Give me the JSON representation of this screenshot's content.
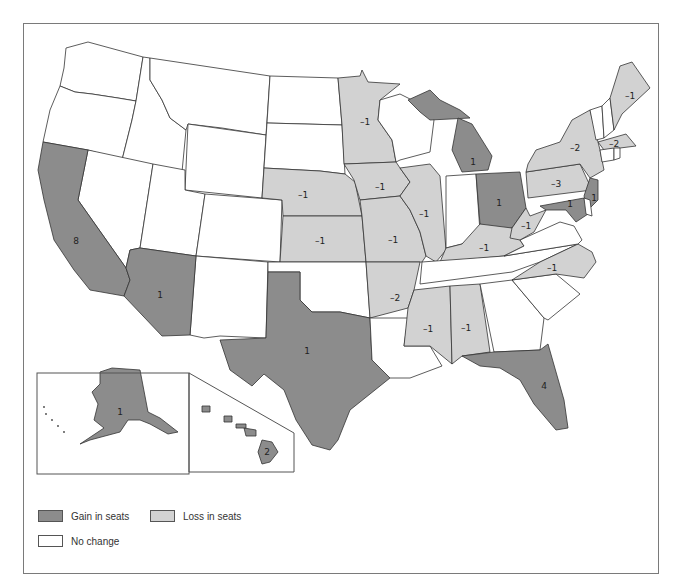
{
  "colors": {
    "gain": "#8c8c8c",
    "loss": "#d2d2d2",
    "none": "#ffffff",
    "border": "#333333"
  },
  "legend": {
    "gain_label": "Gain in seats",
    "loss_label": "Loss in seats",
    "none_label": "No change"
  },
  "chart_data": {
    "type": "choropleth",
    "title": "",
    "legend": [
      "Gain in seats",
      "Loss in seats",
      "No change"
    ],
    "states": [
      {
        "state": "California",
        "category": "gain",
        "change": 8
      },
      {
        "state": "Arizona",
        "category": "gain",
        "change": 1
      },
      {
        "state": "Texas",
        "category": "gain",
        "change": 1
      },
      {
        "state": "Florida",
        "category": "gain",
        "change": 4
      },
      {
        "state": "Michigan",
        "category": "gain",
        "change": 1
      },
      {
        "state": "Ohio",
        "category": "gain",
        "change": 1
      },
      {
        "state": "New Jersey",
        "category": "gain",
        "change": 1
      },
      {
        "state": "Maryland",
        "category": "gain",
        "change": 1
      },
      {
        "state": "Alaska",
        "category": "gain",
        "change": 1
      },
      {
        "state": "Hawaii",
        "category": "gain",
        "change": 2
      },
      {
        "state": "Minnesota",
        "category": "loss",
        "change": -1
      },
      {
        "state": "Nebraska",
        "category": "loss",
        "change": -1
      },
      {
        "state": "Kansas",
        "category": "loss",
        "change": -1
      },
      {
        "state": "Iowa",
        "category": "loss",
        "change": -1
      },
      {
        "state": "Missouri",
        "category": "loss",
        "change": -1
      },
      {
        "state": "Arkansas",
        "category": "loss",
        "change": -2
      },
      {
        "state": "Illinois",
        "category": "loss",
        "change": -1
      },
      {
        "state": "Kentucky",
        "category": "loss",
        "change": -1
      },
      {
        "state": "West Virginia",
        "category": "loss",
        "change": -1
      },
      {
        "state": "North Carolina",
        "category": "loss",
        "change": -1
      },
      {
        "state": "Mississippi",
        "category": "loss",
        "change": -1
      },
      {
        "state": "Alabama",
        "category": "loss",
        "change": -1
      },
      {
        "state": "Pennsylvania",
        "category": "loss",
        "change": -3
      },
      {
        "state": "New York",
        "category": "loss",
        "change": -2
      },
      {
        "state": "Massachusetts",
        "category": "loss",
        "change": -2
      },
      {
        "state": "Maine",
        "category": "loss",
        "change": -1
      }
    ]
  },
  "map": {
    "shapes": [
      {
        "name": "washington",
        "cat": "none",
        "pts": "66,48 88,42 143,57 136,101 118,98 92,94 75,92 60,86 64,68"
      },
      {
        "name": "oregon",
        "cat": "none",
        "pts": "60,86 75,92 92,94 118,98 136,101 132,120 122,160 88,150 43,142 50,110"
      },
      {
        "name": "idaho",
        "cat": "none",
        "pts": "143,57 150,58 150,80 162,100 170,118 186,130 182,172 122,160 132,120 136,101"
      },
      {
        "name": "montana",
        "cat": "none",
        "pts": "150,58 270,76 266,135 222,128 188,124 186,130 170,118 162,100 150,80"
      },
      {
        "name": "wyoming",
        "cat": "none",
        "pts": "188,124 266,135 262,198 185,190"
      },
      {
        "name": "nevada",
        "cat": "none",
        "pts": "88,150 153,164 140,248 130,250 126,268 78,200"
      },
      {
        "name": "utah",
        "cat": "none",
        "pts": "153,164 185,170 185,190 205,194 196,256 140,248"
      },
      {
        "name": "colorado",
        "cat": "none",
        "pts": "205,194 282,200 280,262 196,256"
      },
      {
        "name": "new-mexico",
        "cat": "none",
        "pts": "196,256 268,262 266,338 220,336 204,338 190,335"
      },
      {
        "name": "north-dakota",
        "cat": "none",
        "pts": "270,76 338,78 342,125 267,123"
      },
      {
        "name": "south-dakota",
        "cat": "none",
        "pts": "267,123 342,125 345,174 320,171 264,168"
      },
      {
        "name": "nebraska",
        "cat": "loss",
        "pts": "264,168 320,171 345,174 355,182 362,216 283,216 282,200 262,198"
      },
      {
        "name": "kansas",
        "cat": "loss",
        "pts": "283,216 362,216 366,262 280,262"
      },
      {
        "name": "oklahoma",
        "cat": "none",
        "pts": "268,262 366,262 370,318 340,312 312,312 300,300 300,272 268,272"
      },
      {
        "name": "california",
        "cat": "gain",
        "pts": "43,142 88,150 78,200 126,268 130,280 124,296 90,290 74,270 54,240 44,200 38,170"
      },
      {
        "name": "arizona",
        "cat": "gain",
        "pts": "140,248 196,256 190,335 162,336 124,296 130,280 126,268 130,250"
      },
      {
        "name": "texas",
        "cat": "gain",
        "pts": "268,272 300,272 300,300 312,312 340,312 370,318 372,360 390,378 350,410 338,440 330,450 312,445 296,420 284,390 264,374 252,386 230,370 220,340 266,338"
      },
      {
        "name": "minnesota",
        "cat": "loss",
        "pts": "338,78 360,76 362,70 368,82 400,84 380,100 378,120 392,140 396,162 344,164 342,125"
      },
      {
        "name": "iowa",
        "cat": "loss",
        "pts": "344,164 396,162 400,168 410,182 400,196 360,200 354,180"
      },
      {
        "name": "missouri",
        "cat": "loss",
        "pts": "360,200 400,196 410,210 420,232 426,256 422,262 366,262 362,216"
      },
      {
        "name": "arkansas",
        "cat": "loss",
        "pts": "366,262 420,262 414,290 408,308 370,318"
      },
      {
        "name": "louisiana",
        "cat": "none",
        "pts": "370,318 408,318 404,346 430,346 442,366 410,378 390,378 372,360"
      },
      {
        "name": "wisconsin",
        "cat": "none",
        "pts": "380,100 400,94 420,104 430,110 434,120 430,152 400,160 396,162 392,140 378,120"
      },
      {
        "name": "illinois",
        "cat": "loss",
        "pts": "400,168 430,164 440,176 446,250 436,262 426,256 420,232 410,210 400,196 410,182"
      },
      {
        "name": "michigan-up",
        "cat": "gain",
        "pts": "408,100 430,90 440,100 460,110 470,118 430,120 420,112"
      },
      {
        "name": "michigan",
        "cat": "gain",
        "pts": "458,118 472,124 492,156 488,170 462,172 452,150"
      },
      {
        "name": "indiana",
        "cat": "none",
        "pts": "446,176 476,174 480,232 462,244 446,248"
      },
      {
        "name": "ohio",
        "cat": "gain",
        "pts": "476,174 520,172 526,208 512,228 492,230 480,224"
      },
      {
        "name": "kentucky",
        "cat": "loss",
        "pts": "446,248 462,244 480,224 512,228 524,246 504,256 440,262"
      },
      {
        "name": "tennessee",
        "cat": "none",
        "pts": "422,262 504,256 578,244 540,262 512,272 420,284"
      },
      {
        "name": "mississippi",
        "cat": "loss",
        "pts": "414,290 450,286 452,364 430,346 404,346 408,308"
      },
      {
        "name": "alabama",
        "cat": "loss",
        "pts": "450,286 480,284 490,352 462,356 452,364"
      },
      {
        "name": "georgia",
        "cat": "none",
        "pts": "480,284 512,280 544,318 540,350 494,352"
      },
      {
        "name": "florida",
        "cat": "gain",
        "pts": "462,356 494,352 540,350 548,344 564,400 568,428 556,430 534,404 520,380 500,368 480,366"
      },
      {
        "name": "south-carolina",
        "cat": "none",
        "pts": "512,280 556,274 580,294 548,320 544,318"
      },
      {
        "name": "north-carolina",
        "cat": "loss",
        "pts": "540,262 578,244 592,252 596,262 584,278 556,274 512,280"
      },
      {
        "name": "virginia",
        "cat": "none",
        "pts": "520,240 560,222 574,226 582,240 578,244 504,256 524,246"
      },
      {
        "name": "west-virginia",
        "cat": "loss",
        "pts": "512,228 526,208 530,216 546,210 534,232 520,240 510,238"
      },
      {
        "name": "pennsylvania",
        "cat": "loss",
        "pts": "526,172 580,164 592,190 528,198"
      },
      {
        "name": "new-york",
        "cat": "loss",
        "pts": "528,164 536,150 560,142 572,120 590,110 600,150 604,170 590,178 580,164 526,172"
      },
      {
        "name": "new-jersey",
        "cat": "gain",
        "pts": "590,178 598,180 598,200 588,210 584,196"
      },
      {
        "name": "maryland",
        "cat": "gain",
        "pts": "540,206 584,198 588,214 576,222 566,210 546,210"
      },
      {
        "name": "delaware",
        "cat": "none",
        "pts": "584,198 590,200 592,216 586,214"
      },
      {
        "name": "vermont",
        "cat": "none",
        "pts": "590,110 602,106 604,138 596,140"
      },
      {
        "name": "new-hampshire",
        "cat": "none",
        "pts": "602,106 610,98 614,130 604,138"
      },
      {
        "name": "maine",
        "cat": "loss",
        "pts": "610,98 620,66 632,62 650,88 622,114 614,130"
      },
      {
        "name": "massachusetts",
        "cat": "loss",
        "pts": "598,142 626,134 636,146 604,150"
      },
      {
        "name": "connecticut",
        "cat": "none",
        "pts": "600,150 614,148 614,160 602,162"
      },
      {
        "name": "rhode-island",
        "cat": "none",
        "pts": "614,148 620,148 620,158 614,160"
      },
      {
        "name": "alaska",
        "cat": "gain",
        "pts": "100,372 112,368 140,370 148,412 160,418 178,432 168,434 150,424 140,420 128,420 120,432 90,440 80,444 104,428 94,420 98,404 92,392 100,384"
      },
      {
        "name": "hawaii-big",
        "cat": "gain",
        "pts": "262,440 272,442 278,452 270,462 262,464 258,452"
      },
      {
        "name": "hawaii-maui",
        "cat": "gain",
        "pts": "244,428 256,430 256,436 246,436"
      },
      {
        "name": "hawaii-molokai",
        "cat": "gain",
        "pts": "236,424 246,424 246,428 236,428"
      },
      {
        "name": "hawaii-oahu",
        "cat": "gain",
        "pts": "224,416 232,416 232,422 224,422"
      },
      {
        "name": "hawaii-kauai",
        "cat": "gain",
        "pts": "202,406 210,406 210,412 202,412"
      }
    ],
    "labels": [
      {
        "x": 76,
        "y": 241,
        "text": "8"
      },
      {
        "x": 160,
        "y": 295,
        "text": "1"
      },
      {
        "x": 307,
        "y": 351,
        "text": "1"
      },
      {
        "x": 544,
        "y": 386,
        "text": "4"
      },
      {
        "x": 473,
        "y": 162,
        "text": "1"
      },
      {
        "x": 499,
        "y": 203,
        "text": "1"
      },
      {
        "x": 594,
        "y": 198,
        "text": "1"
      },
      {
        "x": 570,
        "y": 204,
        "text": "1"
      },
      {
        "x": 120,
        "y": 412,
        "text": "1"
      },
      {
        "x": 267,
        "y": 452,
        "text": "2"
      },
      {
        "x": 365,
        "y": 122,
        "text": "-1"
      },
      {
        "x": 303,
        "y": 195,
        "text": "-1"
      },
      {
        "x": 320,
        "y": 241,
        "text": "-1"
      },
      {
        "x": 380,
        "y": 187,
        "text": "-1"
      },
      {
        "x": 393,
        "y": 240,
        "text": "-1"
      },
      {
        "x": 395,
        "y": 298,
        "text": "-2"
      },
      {
        "x": 424,
        "y": 214,
        "text": "-1"
      },
      {
        "x": 484,
        "y": 248,
        "text": "-1"
      },
      {
        "x": 526,
        "y": 226,
        "text": "-1"
      },
      {
        "x": 552,
        "y": 268,
        "text": "-1"
      },
      {
        "x": 428,
        "y": 329,
        "text": "-1"
      },
      {
        "x": 466,
        "y": 328,
        "text": "-1"
      },
      {
        "x": 556,
        "y": 184,
        "text": "-3"
      },
      {
        "x": 575,
        "y": 148,
        "text": "-2"
      },
      {
        "x": 614,
        "y": 144,
        "text": "-2"
      },
      {
        "x": 630,
        "y": 96,
        "text": "-1"
      }
    ],
    "insets": {
      "alaska_box": {
        "x": 37,
        "y": 373,
        "w": 152,
        "h": 101
      },
      "hawaii_box": {
        "pts": "189,373 294,433 294,472 189,472"
      }
    }
  }
}
